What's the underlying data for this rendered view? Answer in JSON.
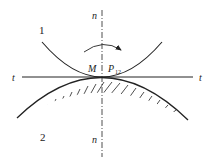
{
  "diagram": {
    "labels": {
      "body1": "1",
      "body2": "2",
      "normal_top": "n",
      "normal_bottom": "n",
      "tangent_left": "t",
      "tangent_right": "t",
      "contact_point": "M",
      "instant_center": "P",
      "instant_center_sub": "12"
    },
    "colors": {
      "stroke": "#222222",
      "background": "#ffffff"
    }
  }
}
